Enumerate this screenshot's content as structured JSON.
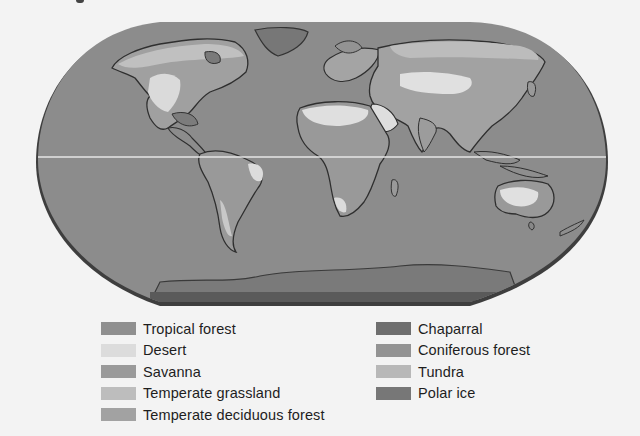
{
  "figure": {
    "type": "world biome map",
    "projection": "Robinson-like rounded world projection with equator line"
  },
  "legend": {
    "left_column": [
      {
        "label": "Tropical forest",
        "color": "#8f8f8f"
      },
      {
        "label": "Desert",
        "color": "#dcdcdc"
      },
      {
        "label": "Savanna",
        "color": "#9a9a9a"
      },
      {
        "label": "Temperate grassland",
        "color": "#bdbdbd"
      },
      {
        "label": "Temperate deciduous forest",
        "color": "#a2a2a2"
      }
    ],
    "right_column": [
      {
        "label": "Chaparral",
        "color": "#6e6e6e"
      },
      {
        "label": "Coniferous forest",
        "color": "#939393"
      },
      {
        "label": "Tundra",
        "color": "#b8b8b8"
      },
      {
        "label": "Polar ice",
        "color": "#777777"
      }
    ]
  },
  "colors": {
    "ocean": "#8c8c8c",
    "ocean_rim": "#4a4a4a",
    "equator_line": "#e6e6e6",
    "background": "#f3f3f3"
  }
}
